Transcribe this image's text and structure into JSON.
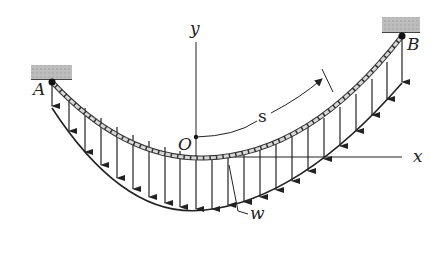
{
  "diagram": {
    "type": "cable-under-distributed-load",
    "labels": {
      "support_a": "A",
      "support_b": "B",
      "origin": "O",
      "y_axis": "y",
      "x_axis": "x",
      "arc_length": "s",
      "load": "w"
    },
    "colors": {
      "line": "#222222",
      "support": "#b5b5b5",
      "cable": "#cfcfcf"
    },
    "arrow_count": 24
  }
}
